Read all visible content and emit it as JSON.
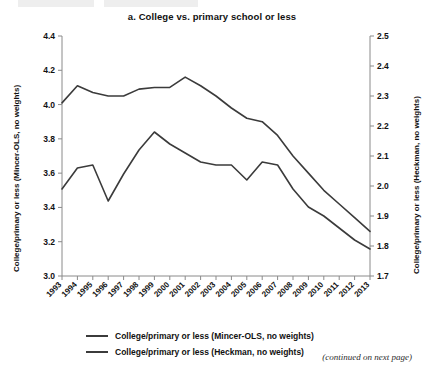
{
  "figure": {
    "title": "a. College vs. primary school or less",
    "footnote": "(continued on next page)"
  },
  "axes": {
    "left_label": "College/primary or less (Mincer-OLS, no weights)",
    "right_label": "College/primary or less (Heckman, no weights)",
    "left_ticks": [
      "4.4",
      "4.2",
      "4.0",
      "3.8",
      "3.6",
      "3.4",
      "3.2",
      "3.0"
    ],
    "right_ticks": [
      "2.5",
      "2.4",
      "2.3",
      "2.2",
      "2.1",
      "2.0",
      "1.9",
      "1.8",
      "1.7"
    ]
  },
  "legend": {
    "items": [
      {
        "label": "College/primary or less (Mincer-OLS, no weights)",
        "color": "#3b3b3b"
      },
      {
        "label": "College/primary or less (Heckman, no weights)",
        "color": "#3b3b3b"
      }
    ]
  },
  "chart_data": {
    "type": "line",
    "title": "a. College vs. primary school or less",
    "xlabel": "",
    "ylabel": "College/primary or less (Mincer-OLS, no weights)",
    "y2label": "College/primary or less (Heckman, no weights)",
    "categories": [
      "1993",
      "1994",
      "1995",
      "1996",
      "1997",
      "1998",
      "1999",
      "2000",
      "2001",
      "2002",
      "2003",
      "2004",
      "2005",
      "2006",
      "2007",
      "2008",
      "2009",
      "2010",
      "2011",
      "2012",
      "2013"
    ],
    "ylim": [
      3.0,
      4.4
    ],
    "y2lim": [
      1.7,
      2.5
    ],
    "grid": false,
    "legend_position": "bottom",
    "series": [
      {
        "name": "College/primary or less (Mincer-OLS, no weights)",
        "axis": "left",
        "color": "#3b3b3b",
        "values": [
          4.01,
          4.11,
          4.07,
          4.05,
          4.05,
          4.09,
          4.1,
          4.1,
          4.16,
          4.11,
          4.05,
          3.98,
          3.92,
          3.9,
          3.82,
          3.7,
          3.6,
          3.5,
          3.42,
          3.34,
          3.26
        ]
      },
      {
        "name": "College/primary or less (Heckman, no weights)",
        "axis": "right",
        "color": "#3b3b3b",
        "values": [
          1.99,
          2.06,
          2.07,
          1.95,
          2.04,
          2.12,
          2.18,
          2.14,
          2.11,
          2.08,
          2.07,
          2.07,
          2.02,
          2.08,
          2.07,
          1.99,
          1.93,
          1.9,
          1.86,
          1.82,
          1.79
        ]
      }
    ]
  }
}
